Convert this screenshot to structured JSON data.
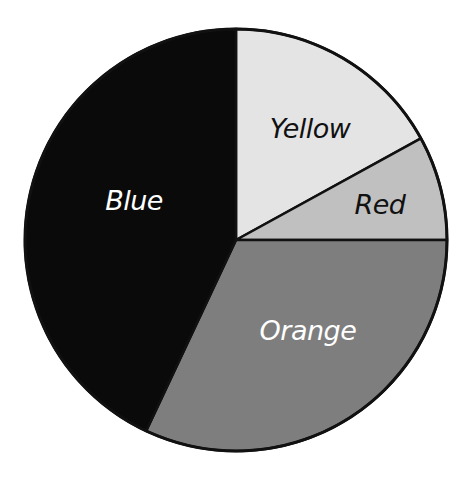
{
  "chart_data": {
    "type": "pie",
    "title": "",
    "categories": [
      "Yellow",
      "Red",
      "Orange",
      "Blue"
    ],
    "values": [
      17,
      8,
      32,
      43
    ],
    "units": "percent (estimated from slice angles)",
    "start_angle_deg_clockwise_from_top": 0,
    "direction": "clockwise",
    "legend": "none (labels drawn inside slices)",
    "slices": [
      {
        "label": "Yellow",
        "value": 17,
        "fill": "#e4e4e4",
        "label_color": "#111111"
      },
      {
        "label": "Red",
        "value": 8,
        "fill": "#c0c0c0",
        "label_color": "#111111"
      },
      {
        "label": "Orange",
        "value": 32,
        "fill": "#7e7e7e",
        "label_color": "#ffffff"
      },
      {
        "label": "Blue",
        "value": 43,
        "fill": "#0a0a0a",
        "label_color": "#ffffff"
      }
    ]
  },
  "labels": {
    "yellow": "Yellow",
    "red": "Red",
    "orange": "Orange",
    "blue": "Blue"
  },
  "colors": {
    "outline": "#111111",
    "background": "#ffffff"
  }
}
